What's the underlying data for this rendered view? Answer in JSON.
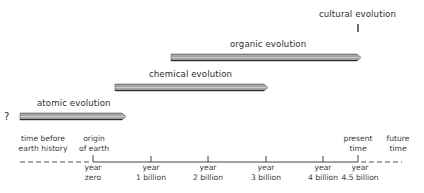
{
  "diagram": {
    "type": "timeline",
    "phases": [
      {
        "label": "cultural evolution",
        "marker": "short vertical mark at present time"
      },
      {
        "label": "organic evolution",
        "start_billion_years": 1.35,
        "end_billion_years": 4.6
      },
      {
        "label": "chemical evolution",
        "start_billion_years": 0.4,
        "end_billion_years": 3.05
      },
      {
        "label": "atomic evolution",
        "start": "unknown",
        "start_marker": "?",
        "end_billion_years": 0.6
      }
    ],
    "question_mark": "?",
    "eras": {
      "before": "time before earth history",
      "before_line1": "time before",
      "before_line2": "earth history",
      "origin_line1": "origin",
      "origin_line2": "of earth",
      "present_line1": "present",
      "present_line2": "time",
      "future_line1": "future",
      "future_line2": "time"
    },
    "ticks": [
      {
        "line1": "year",
        "line2": "zero",
        "value": 0
      },
      {
        "line1": "year",
        "line2": "1 billion",
        "value": 1
      },
      {
        "line1": "year",
        "line2": "2 billion",
        "value": 2
      },
      {
        "line1": "year",
        "line2": "3 billion",
        "value": 3
      },
      {
        "line1": "year",
        "line2": "4 billion",
        "value": 4
      },
      {
        "line1": "year",
        "line2": "4.5 billion",
        "value": 4.5
      }
    ],
    "colors": {
      "line": "#3a3a3a",
      "bar_dark": "#2a2a2a",
      "bar_mid": "#8c8c8c",
      "bar_light": "#d8d8d8"
    }
  }
}
